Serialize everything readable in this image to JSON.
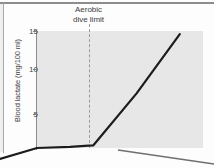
{
  "figure": {
    "background_color": "#fdfdfd",
    "plot_background_color": "#e7e7e7",
    "line_color": "#1c1c1c",
    "axis_color": "#8a8a8a",
    "dashed_marker_color": "#9b9b9b"
  },
  "annotation": {
    "adl_line_1": "Aerobic",
    "adl_line_2": "dive limit"
  },
  "axis": {
    "y_title": "Blood lactate (mg/100 ml)",
    "y_ticks": [
      "15",
      "10",
      "5"
    ]
  },
  "chart_data": {
    "type": "line",
    "title": "",
    "subtitle": "",
    "xlabel": "",
    "ylabel": "Blood lactate (mg/100 ml)",
    "ylim": [
      0,
      15
    ],
    "yticks": [
      5,
      10,
      15
    ],
    "xlim": [
      0,
      100
    ],
    "xticks": [],
    "grid": false,
    "legend": null,
    "annotations": [
      {
        "text": "Aerobic dive limit",
        "type": "vertical-dashed-line",
        "x": 31,
        "style": "dashed",
        "color": "#9b9b9b",
        "label_position": "above-axis"
      }
    ],
    "series": [
      {
        "name": "Blood lactate",
        "color": "#1c1c1c",
        "x": [
          0,
          20,
          31,
          34,
          60,
          86
        ],
        "y": [
          0.0,
          0.15,
          0.3,
          0.35,
          7.0,
          14.6
        ],
        "description": "Flat near baseline until the aerobic dive limit, then a steep linear rise"
      }
    ]
  }
}
